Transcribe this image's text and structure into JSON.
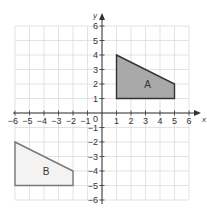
{
  "diagram": {
    "type": "coordinate-grid",
    "axes": {
      "x_label": "x",
      "y_label": "y",
      "origin_label": "0",
      "x_range": [
        -6,
        6
      ],
      "y_range": [
        -6,
        6
      ],
      "x_ticks": [
        "−6",
        "−5",
        "−4",
        "−3",
        "−2",
        "−1",
        "1",
        "2",
        "3",
        "4",
        "5",
        "6"
      ],
      "y_ticks": [
        "6",
        "5",
        "4",
        "3",
        "2",
        "1",
        "−1",
        "−2",
        "−3",
        "−4",
        "−5",
        "−6"
      ]
    },
    "shapes": [
      {
        "label": "A",
        "vertices": [
          [
            1,
            1
          ],
          [
            1,
            4
          ],
          [
            5,
            2
          ],
          [
            5,
            1
          ]
        ],
        "fill": "#a9a9a9",
        "stroke": "#333333"
      },
      {
        "label": "B",
        "vertices": [
          [
            -6,
            -5
          ],
          [
            -6,
            -2
          ],
          [
            -2,
            -4
          ],
          [
            -2,
            -5
          ]
        ],
        "fill": "#f3f3f3",
        "stroke": "#777777"
      }
    ],
    "colors": {
      "grid": "#dcdcdc",
      "axis": "#333333",
      "text": "#333333"
    }
  }
}
